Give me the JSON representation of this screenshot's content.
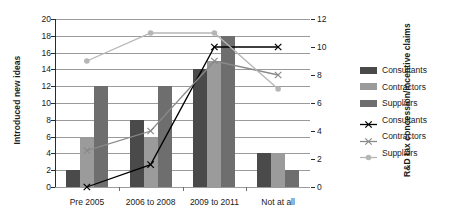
{
  "chart_data": {
    "type": "bar",
    "title": "",
    "subtitle": "",
    "categories": [
      "Pre 2005",
      "2006 to 2008",
      "2009 to 2011",
      "Not at all"
    ],
    "xlabel": "",
    "ylabel": "Introduced new ideas",
    "ylabel_secondary": "R&D tax concession/incentive claims",
    "ylim": [
      0,
      20
    ],
    "ylim_secondary": [
      0,
      12
    ],
    "yticks": [
      0,
      2,
      4,
      6,
      8,
      10,
      12,
      14,
      16,
      18,
      20
    ],
    "yticks_secondary": [
      0,
      2,
      4,
      6,
      8,
      10,
      12
    ],
    "grid": true,
    "legend_position": "right",
    "series": [
      {
        "name": "Consultants",
        "kind": "bar",
        "axis": "left",
        "color": "#4a4a4a",
        "values": [
          2,
          8,
          14,
          4
        ]
      },
      {
        "name": "Contractors",
        "kind": "bar",
        "axis": "left",
        "color": "#9b9b9b",
        "values": [
          6,
          6,
          15,
          4
        ]
      },
      {
        "name": "Suppliers",
        "kind": "bar",
        "axis": "left",
        "color": "#6e6e6e",
        "values": [
          12,
          12,
          18,
          2
        ]
      },
      {
        "name": "Consultants",
        "kind": "line",
        "axis": "right",
        "color": "#000000",
        "marker": "x",
        "values": [
          0,
          1.6,
          10,
          10
        ]
      },
      {
        "name": "Contractors",
        "kind": "line",
        "axis": "right",
        "color": "#8a8a8a",
        "marker": "x",
        "values": [
          2.6,
          4.0,
          9.0,
          8.0
        ]
      },
      {
        "name": "Suppliers",
        "kind": "line",
        "axis": "right",
        "color": "#b6b6b6",
        "marker": "circle",
        "values": [
          9.0,
          11.0,
          11.0,
          7.0
        ]
      }
    ]
  },
  "legend": {
    "items": [
      {
        "label": "Consultants",
        "kind": "bar",
        "color": "#4a4a4a",
        "marker": "none"
      },
      {
        "label": "Contractors",
        "kind": "bar",
        "color": "#9b9b9b",
        "marker": "none"
      },
      {
        "label": "Suppliers",
        "kind": "bar",
        "color": "#6e6e6e",
        "marker": "none"
      },
      {
        "label": "Consultants",
        "kind": "line",
        "color": "#000000",
        "marker": "x"
      },
      {
        "label": "Contractors",
        "kind": "line",
        "color": "#8a8a8a",
        "marker": "x"
      },
      {
        "label": "Suppliers",
        "kind": "line",
        "color": "#b6b6b6",
        "marker": "circle"
      }
    ]
  }
}
